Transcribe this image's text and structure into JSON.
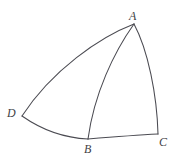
{
  "figure": {
    "type": "geometric-diagram",
    "background_color": "#ffffff",
    "stroke_color": "#4b4b52",
    "stroke_width": 1.05,
    "canvas": {
      "width": 177,
      "height": 160
    },
    "vertices": [
      {
        "id": "A",
        "label": "A",
        "x": 134,
        "y": 24
      },
      {
        "id": "B",
        "label": "B",
        "x": 88,
        "y": 139
      },
      {
        "id": "C",
        "label": "C",
        "x": 158,
        "y": 134
      },
      {
        "id": "D",
        "label": "D",
        "x": 22,
        "y": 116
      }
    ],
    "labels": {
      "A": "A",
      "B": "B",
      "C": "C",
      "D": "D"
    },
    "edges": [
      {
        "id": "arc-AD",
        "from": "A",
        "to": "D",
        "kind": "arc",
        "path": "M 134 24 C 100 37 52 70 22 116"
      },
      {
        "id": "arc-AB",
        "from": "A",
        "to": "B",
        "kind": "arc",
        "path": "M 134 24 C 114 52 94 94 88 139"
      },
      {
        "id": "arc-AC",
        "from": "A",
        "to": "C",
        "kind": "arc",
        "path": "M 134 24 C 148 50 157 95 158 134"
      },
      {
        "id": "arc-DB",
        "from": "D",
        "to": "B",
        "kind": "arc",
        "path": "M 22 116 C 42 130 66 138 88 139"
      },
      {
        "id": "arc-BC",
        "from": "B",
        "to": "C",
        "kind": "arc",
        "path": "M 88 139 C 112 137 138 135 158 134"
      }
    ]
  }
}
